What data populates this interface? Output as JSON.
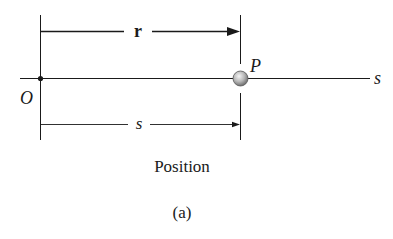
{
  "diagram": {
    "position_vector_label": "r",
    "point_label": "P",
    "axis_label": "s",
    "origin_label": "O",
    "distance_label": "s",
    "caption": "Position",
    "subfigure_label": "(a)"
  },
  "colors": {
    "line": "#1a1a1a",
    "particle_light": "#f2f2f2",
    "particle_dark": "#7a7a7a",
    "background": "#ffffff"
  }
}
